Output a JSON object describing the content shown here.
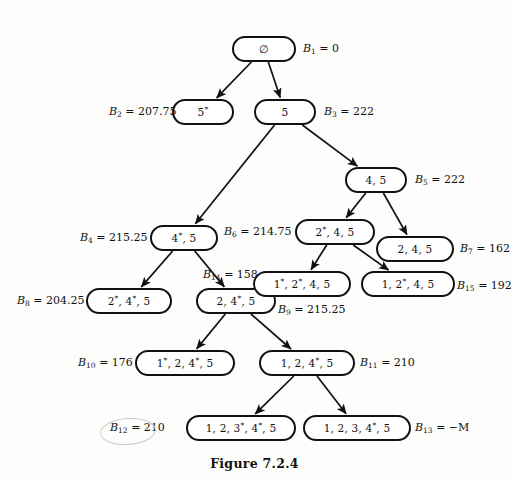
{
  "figure": {
    "caption": "Figure 7.2.4",
    "root_symbol": "∅"
  },
  "nodes": [
    {
      "id": "n1",
      "label": "∅",
      "x": 232,
      "y": 36,
      "w": 64,
      "h": 26
    },
    {
      "id": "n2",
      "label": "5*",
      "x": 172,
      "y": 99,
      "w": 62,
      "h": 26
    },
    {
      "id": "n3",
      "label": "5",
      "x": 254,
      "y": 99,
      "w": 62,
      "h": 26
    },
    {
      "id": "n5",
      "label": "4, 5",
      "x": 345,
      "y": 167,
      "w": 62,
      "h": 26
    },
    {
      "id": "n4",
      "label": "4*, 5",
      "x": 150,
      "y": 225,
      "w": 68,
      "h": 26
    },
    {
      "id": "n6",
      "label": "2*, 4, 5",
      "x": 295,
      "y": 219,
      "w": 80,
      "h": 26
    },
    {
      "id": "n7",
      "label": "2, 4, 5",
      "x": 376,
      "y": 236,
      "w": 78,
      "h": 26
    },
    {
      "id": "n8",
      "label": "2*, 4*, 5",
      "x": 86,
      "y": 288,
      "w": 86,
      "h": 26
    },
    {
      "id": "n9",
      "label": "2, 4*, 5",
      "x": 196,
      "y": 288,
      "w": 80,
      "h": 26
    },
    {
      "id": "n14",
      "label": "1*, 2*, 4, 5",
      "x": 253,
      "y": 271,
      "w": 98,
      "h": 26
    },
    {
      "id": "n15",
      "label": "1, 2*, 4, 5",
      "x": 361,
      "y": 271,
      "w": 94,
      "h": 26
    },
    {
      "id": "n10",
      "label": "1*, 2, 4*, 5",
      "x": 135,
      "y": 350,
      "w": 100,
      "h": 26
    },
    {
      "id": "n11",
      "label": "1, 2, 4*, 5",
      "x": 259,
      "y": 350,
      "w": 96,
      "h": 26
    },
    {
      "id": "n12",
      "label": "1, 2, 3*, 4*, 5",
      "x": 186,
      "y": 415,
      "w": 110,
      "h": 26
    },
    {
      "id": "n13",
      "label": "1, 2, 3, 4*, 5",
      "x": 303,
      "y": 415,
      "w": 108,
      "h": 26
    }
  ],
  "bounds": [
    {
      "id": "b1",
      "sub": "1",
      "value": "0",
      "x": 303,
      "y": 42,
      "align": "left"
    },
    {
      "id": "b2",
      "sub": "2",
      "value": "207.75",
      "x": 109,
      "y": 105,
      "align": "left"
    },
    {
      "id": "b3",
      "sub": "3",
      "value": "222",
      "x": 324,
      "y": 105,
      "align": "left"
    },
    {
      "id": "b5",
      "sub": "5",
      "value": "222",
      "x": 415,
      "y": 173,
      "align": "left"
    },
    {
      "id": "b4",
      "sub": "4",
      "value": "215.25",
      "x": 80,
      "y": 231,
      "align": "left"
    },
    {
      "id": "b6",
      "sub": "6",
      "value": "214.75",
      "x": 224,
      "y": 225,
      "align": "left"
    },
    {
      "id": "b7",
      "sub": "7",
      "value": "162",
      "x": 460,
      "y": 242,
      "align": "left"
    },
    {
      "id": "b14",
      "sub": "14",
      "value": "158",
      "x": 203,
      "y": 268,
      "align": "left"
    },
    {
      "id": "b15",
      "sub": "15",
      "value": "192",
      "x": 457,
      "y": 279,
      "align": "left"
    },
    {
      "id": "b8",
      "sub": "8",
      "value": "204.25",
      "x": 17,
      "y": 294,
      "align": "left"
    },
    {
      "id": "b9",
      "sub": "9",
      "value": "215.25",
      "x": 278,
      "y": 303,
      "align": "left"
    },
    {
      "id": "b10",
      "sub": "10",
      "value": "176",
      "x": 78,
      "y": 356,
      "align": "left"
    },
    {
      "id": "b11",
      "sub": "11",
      "value": "210",
      "x": 360,
      "y": 356,
      "align": "left"
    },
    {
      "id": "b12",
      "sub": "12",
      "value": "210",
      "x": 110,
      "y": 421,
      "align": "left"
    },
    {
      "id": "b13",
      "sub": "13",
      "value": "−M",
      "x": 415,
      "y": 421,
      "align": "left"
    }
  ],
  "edges": [
    {
      "from": "n1",
      "to": "n2"
    },
    {
      "from": "n1",
      "to": "n3"
    },
    {
      "from": "n3",
      "to": "n4"
    },
    {
      "from": "n3",
      "to": "n5"
    },
    {
      "from": "n5",
      "to": "n6"
    },
    {
      "from": "n5",
      "to": "n7"
    },
    {
      "from": "n6",
      "to": "n14"
    },
    {
      "from": "n6",
      "to": "n15"
    },
    {
      "from": "n4",
      "to": "n8"
    },
    {
      "from": "n4",
      "to": "n9"
    },
    {
      "from": "n9",
      "to": "n10"
    },
    {
      "from": "n9",
      "to": "n11"
    },
    {
      "from": "n11",
      "to": "n12"
    },
    {
      "from": "n11",
      "to": "n13"
    }
  ],
  "annotation": {
    "name": "handdrawn-ellipse-around-b12",
    "x": 100,
    "y": 418,
    "w": 54,
    "h": 25,
    "color": "#c9c9cf"
  },
  "colors": {
    "ink": "#111111",
    "page": "#fdfdfc",
    "node_fill": "#ffffff",
    "annotation": "#c9c9cf"
  }
}
